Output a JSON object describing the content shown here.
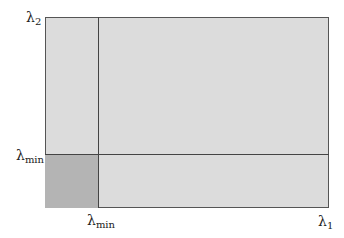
{
  "diagram": {
    "labels": {
      "y_axis_top": {
        "symbol": "λ",
        "sub": "2"
      },
      "y_threshold": {
        "symbol": "λ",
        "sub": "min"
      },
      "x_threshold": {
        "symbol": "λ",
        "sub": "min"
      },
      "x_axis_right": {
        "symbol": "λ",
        "sub": "1"
      }
    },
    "colors": {
      "region_fill": "#dcdcdc",
      "corner_fill": "#b4b4b4",
      "lines": "#444444"
    }
  }
}
